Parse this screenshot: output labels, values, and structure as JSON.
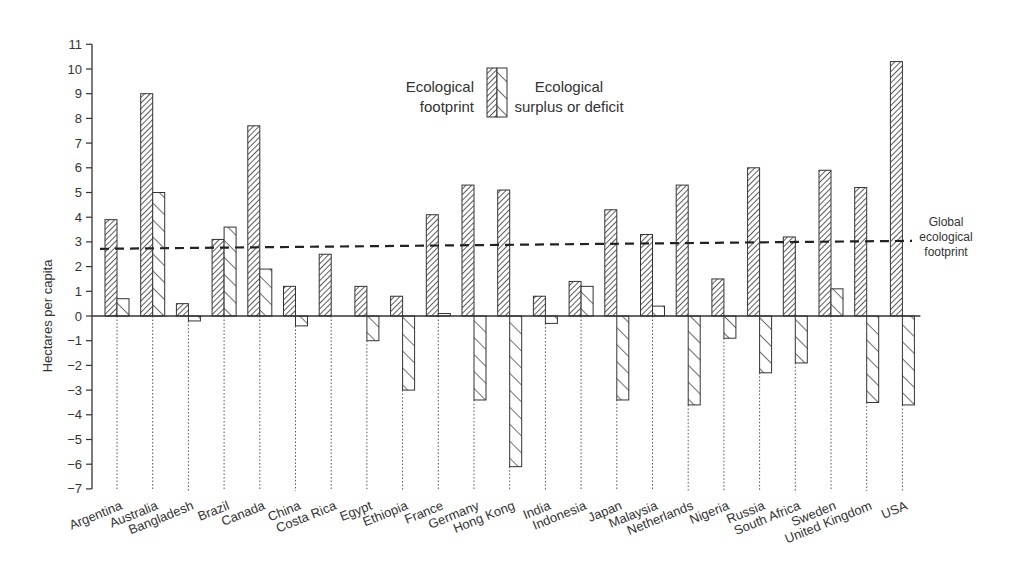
{
  "chart_data": {
    "type": "bar",
    "title": "",
    "xlabel": "",
    "ylabel": "Hectares per capita",
    "ylim": [
      -7,
      11
    ],
    "yticks": [
      -7,
      -6,
      -5,
      -4,
      -3,
      -2,
      -1,
      0,
      1,
      2,
      3,
      4,
      5,
      6,
      7,
      8,
      9,
      10,
      11
    ],
    "grid": false,
    "legend_position": "top-center",
    "categories": [
      "Argentina",
      "Australia",
      "Bangladesh",
      "Brazil",
      "Canada",
      "China",
      "Costa Rica",
      "Egypt",
      "Ethiopia",
      "France",
      "Germany",
      "Hong Kong",
      "India",
      "Indonesia",
      "Japan",
      "Malaysia",
      "Netherlands",
      "Nigeria",
      "Russia",
      "South Africa",
      "Sweden",
      "United Kingdom",
      "USA"
    ],
    "series": [
      {
        "name": "Ecological footprint",
        "pattern": "dense-diagonal-hatch",
        "values": [
          3.9,
          9.0,
          0.5,
          3.1,
          7.7,
          1.2,
          2.5,
          1.2,
          0.8,
          4.1,
          5.3,
          5.1,
          0.8,
          1.4,
          4.3,
          3.3,
          5.3,
          1.5,
          6.0,
          3.2,
          5.9,
          5.2,
          10.3
        ]
      },
      {
        "name": "Ecological surplus or deficit",
        "pattern": "sparse-backslash-hatch",
        "values": [
          0.7,
          5.0,
          -0.2,
          3.6,
          1.9,
          -0.4,
          0.0,
          -1.0,
          -3.0,
          0.1,
          -3.4,
          -6.1,
          -0.3,
          1.2,
          -3.4,
          0.4,
          -3.6,
          -0.9,
          -2.3,
          -1.9,
          1.1,
          -3.5,
          -3.6
        ]
      }
    ],
    "reference_line": {
      "name": "Global ecological footprint",
      "value": 2.8,
      "style": "dashed"
    },
    "annotations": [
      "Global ecological footprint"
    ]
  },
  "legend": {
    "footprint_line1": "Ecological",
    "footprint_line2": "footprint",
    "surplus_line1": "Ecological",
    "surplus_line2": "surplus or deficit"
  },
  "reference_label": {
    "line1": "Global",
    "line2": "ecological",
    "line3": "footprint"
  },
  "colors": {
    "ink": "#2a2a2a",
    "background": "#ffffff"
  }
}
